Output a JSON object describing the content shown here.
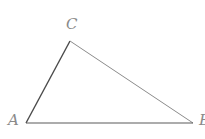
{
  "diagram": {
    "type": "triangle",
    "vertices": [
      {
        "label": "A",
        "x": 26,
        "y": 123
      },
      {
        "label": "B",
        "x": 193,
        "y": 123
      },
      {
        "label": "C",
        "x": 70,
        "y": 41
      }
    ],
    "labels": {
      "a": "A",
      "b": "B",
      "c": "C"
    },
    "colors": {
      "side_ac": "#4a4a4a",
      "side_ab": "#5a5a5a",
      "side_cb": "#8c8c8c",
      "label": "#8a8a8a"
    }
  }
}
